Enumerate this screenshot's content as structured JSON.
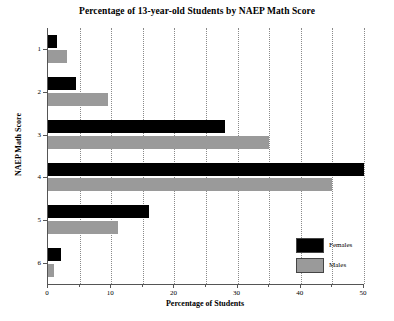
{
  "chart_data": {
    "type": "bar",
    "orientation": "horizontal",
    "title": "Percentage of 13-year-old Students by NAEP Math Score",
    "xlabel": "Percentage of Students",
    "ylabel": "NAEP Math Score",
    "categories": [
      "1",
      "2",
      "3",
      "4",
      "5",
      "6"
    ],
    "series": [
      {
        "name": "Females",
        "color": "#000000",
        "values": [
          1.5,
          4.5,
          28,
          50,
          16,
          2
        ]
      },
      {
        "name": "Males",
        "color": "#9a9a9a",
        "values": [
          3,
          9.5,
          35,
          45,
          11,
          1
        ]
      }
    ],
    "xlim": [
      0,
      50
    ],
    "xticks": [
      0,
      10,
      20,
      30,
      40,
      50
    ],
    "xticklabels": [
      "0",
      "10",
      "20",
      "30",
      "40",
      "50"
    ],
    "xminorticks": [
      5,
      15,
      25,
      35,
      45
    ],
    "grid": "vertical-dotted",
    "legend_position": "bottom-right",
    "legend": [
      "Females",
      "Males"
    ]
  }
}
